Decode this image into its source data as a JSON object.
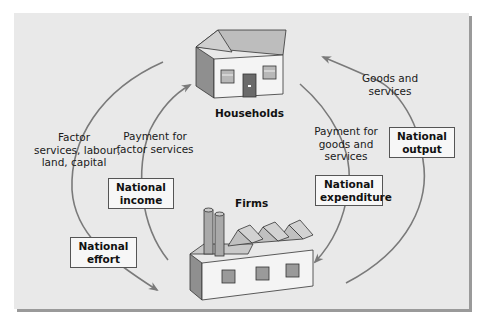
{
  "diagram": {
    "nodes": {
      "households": "Households",
      "firms": "Firms"
    },
    "flows": {
      "factor_services": [
        "Factor",
        "services, labour,",
        "land, capital"
      ],
      "payment_factor": [
        "Payment for",
        "factor services"
      ],
      "payment_goods": [
        "Payment for",
        "goods and",
        "services"
      ],
      "goods_services": [
        "Goods and",
        "services"
      ]
    },
    "boxes": {
      "national_income": [
        "National",
        "income"
      ],
      "national_effort": [
        "National",
        "effort"
      ],
      "national_expenditure": [
        "National",
        "expenditure"
      ],
      "national_output": [
        "National",
        "output"
      ]
    },
    "colors": {
      "panel": "#e9e9e9",
      "arrow": "#7a7a7a",
      "box_bg": "#f7f7f7",
      "house_wall": "#f4f4f4",
      "roof": "#bdbdbd",
      "door": "#6a6a6a"
    }
  }
}
